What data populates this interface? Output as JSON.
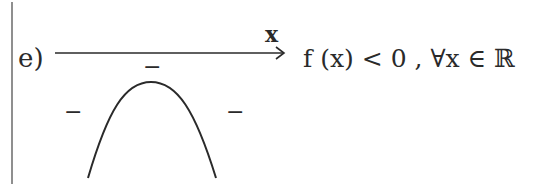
{
  "item": {
    "label": "e)"
  },
  "axis": {
    "variable": "x"
  },
  "signs": {
    "top": "−",
    "left": "−",
    "right": "−"
  },
  "conclusion": {
    "text": "f (x) < 0 , ∀x ∈ ℝ"
  },
  "colors": {
    "ink": "#2a2a2a",
    "background": "#ffffff"
  }
}
